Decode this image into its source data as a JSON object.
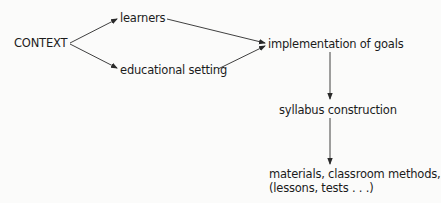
{
  "diagram": {
    "type": "flowchart",
    "nodes": {
      "context": "CONTEXT",
      "learners": "learners",
      "setting": "educational setting",
      "implementation": "implementation of goals",
      "syllabus": "syllabus construction",
      "materials_line1": "materials, classroom methods,",
      "materials_line2": "(lessons, tests . . .)"
    },
    "edges": [
      {
        "from": "context",
        "to": "learners"
      },
      {
        "from": "context",
        "to": "setting"
      },
      {
        "from": "learners",
        "to": "implementation"
      },
      {
        "from": "setting",
        "to": "implementation"
      },
      {
        "from": "implementation",
        "to": "syllabus"
      },
      {
        "from": "syllabus",
        "to": "materials"
      }
    ],
    "colors": {
      "text": "#1c1c1c",
      "arrow": "#2a2a2a",
      "background": "#fbfbfa"
    }
  }
}
